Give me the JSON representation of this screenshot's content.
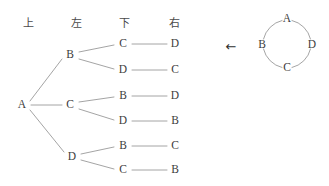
{
  "figure": {
    "background_color": "#ffffff",
    "line_color": "#9a9a9a",
    "text_color": "#3d3d3d"
  },
  "headers": [
    {
      "label": "上",
      "meaning": "up",
      "x": 28,
      "y": 22
    },
    {
      "label": "左",
      "meaning": "left",
      "x": 76,
      "y": 22
    },
    {
      "label": "下",
      "meaning": "down",
      "x": 124,
      "y": 22
    },
    {
      "label": "右",
      "meaning": "right",
      "x": 174,
      "y": 22
    }
  ],
  "tree": {
    "root": {
      "label": "A",
      "x": 22,
      "y": 105
    },
    "level2": [
      {
        "label": "B",
        "x": 70,
        "y": 55
      },
      {
        "label": "C",
        "x": 70,
        "y": 105
      },
      {
        "label": "D",
        "x": 72,
        "y": 157
      }
    ],
    "level3": [
      {
        "label": "C",
        "x": 123,
        "y": 44
      },
      {
        "label": "D",
        "x": 123,
        "y": 70
      },
      {
        "label": "B",
        "x": 123,
        "y": 96
      },
      {
        "label": "D",
        "x": 123,
        "y": 121
      },
      {
        "label": "B",
        "x": 123,
        "y": 146
      },
      {
        "label": "C",
        "x": 123,
        "y": 170
      }
    ],
    "level4": [
      {
        "label": "D",
        "x": 175,
        "y": 44
      },
      {
        "label": "C",
        "x": 175,
        "y": 70
      },
      {
        "label": "D",
        "x": 175,
        "y": 96
      },
      {
        "label": "B",
        "x": 175,
        "y": 121
      },
      {
        "label": "C",
        "x": 175,
        "y": 146
      },
      {
        "label": "B",
        "x": 175,
        "y": 170
      }
    ],
    "paths": [
      [
        "A",
        "B",
        "C",
        "D"
      ],
      [
        "A",
        "B",
        "D",
        "C"
      ],
      [
        "A",
        "C",
        "B",
        "D"
      ],
      [
        "A",
        "C",
        "D",
        "B"
      ],
      [
        "A",
        "D",
        "B",
        "C"
      ],
      [
        "A",
        "D",
        "C",
        "B"
      ]
    ]
  },
  "arrow": {
    "glyph": "←",
    "x": 231,
    "y": 46
  },
  "cycle": {
    "center_x": 287,
    "center_y": 44,
    "radius": 25,
    "nodes": [
      {
        "label": "A",
        "position": "top",
        "x": 287,
        "y": 19
      },
      {
        "label": "B",
        "position": "left",
        "x": 262,
        "y": 45
      },
      {
        "label": "D",
        "position": "right",
        "x": 312,
        "y": 45
      },
      {
        "label": "C",
        "position": "bottom",
        "x": 287,
        "y": 68
      }
    ]
  }
}
